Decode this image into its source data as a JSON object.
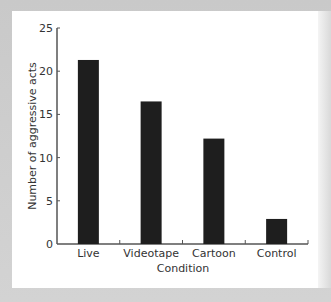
{
  "chart_data": {
    "type": "bar",
    "title": "",
    "xlabel": "Condition",
    "ylabel": "Number of aggressive acts",
    "categories": [
      "Live",
      "Videotape",
      "Cartoon",
      "Control"
    ],
    "values": [
      21.3,
      16.5,
      12.2,
      2.9
    ],
    "ylim": [
      0,
      25
    ],
    "yticks": [
      0,
      5,
      10,
      15,
      20,
      25
    ],
    "grid": false,
    "legend": null,
    "bar_color": "#1e1e1e",
    "axis_color": "#555555"
  }
}
